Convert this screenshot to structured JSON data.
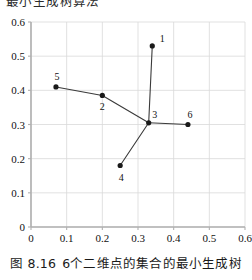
{
  "figure": {
    "clipped_header_text": "最小生成树算法",
    "caption_number": "图 8.16",
    "caption_text": "6个二维点的集合的最小生成树"
  },
  "axes": {
    "x_ticks": [
      "0",
      "0.1",
      "0.2",
      "0.3",
      "0.4",
      "0.5",
      "0.6"
    ],
    "y_ticks": [
      "0",
      "0.1",
      "0.2",
      "0.3",
      "0.4",
      "0.5",
      "0.6"
    ]
  },
  "colors": {
    "grid": "#d9d9d9",
    "axis": "#b0b0b0",
    "point": "#1a1a1a",
    "edge": "#3a3a3a",
    "text": "#111111"
  },
  "chart_data": {
    "type": "scatter",
    "title": "",
    "subtitle": "",
    "xlabel": "",
    "ylabel": "",
    "xlim": [
      0,
      0.6
    ],
    "ylim": [
      0,
      0.6
    ],
    "grid": true,
    "legend": "none",
    "xticks": [
      0,
      0.1,
      0.2,
      0.3,
      0.4,
      0.5,
      0.6
    ],
    "yticks": [
      0,
      0.1,
      0.2,
      0.3,
      0.4,
      0.5,
      0.6
    ],
    "points": [
      {
        "label": "1",
        "x": 0.34,
        "y": 0.53,
        "label_dx": 10,
        "label_dy": -8
      },
      {
        "label": "2",
        "x": 0.2,
        "y": 0.385,
        "label_dx": 0,
        "label_dy": 11
      },
      {
        "label": "3",
        "x": 0.33,
        "y": 0.305,
        "label_dx": 6,
        "label_dy": -9
      },
      {
        "label": "4",
        "x": 0.25,
        "y": 0.18,
        "label_dx": 1,
        "label_dy": 11
      },
      {
        "label": "5",
        "x": 0.07,
        "y": 0.41,
        "label_dx": 1,
        "label_dy": -11
      },
      {
        "label": "6",
        "x": 0.44,
        "y": 0.3,
        "label_dx": 2,
        "label_dy": -11
      }
    ],
    "edges": [
      {
        "from": "5",
        "to": "2"
      },
      {
        "from": "2",
        "to": "3"
      },
      {
        "from": "3",
        "to": "1"
      },
      {
        "from": "3",
        "to": "6"
      },
      {
        "from": "3",
        "to": "4"
      }
    ],
    "annotations": []
  }
}
